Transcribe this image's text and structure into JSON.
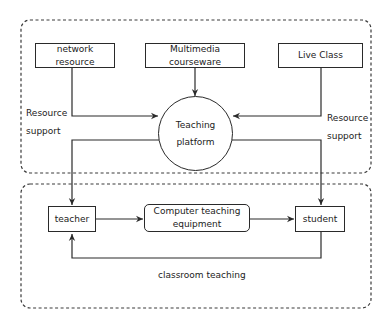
{
  "diagram": {
    "top_group": {
      "sources": [
        {
          "id": "network",
          "label": "network resource"
        },
        {
          "id": "multimedia",
          "label": "Multimedia courseware"
        },
        {
          "id": "live",
          "label": "Live Class"
        }
      ],
      "hub": {
        "line1": "Teaching",
        "line2": "platform"
      },
      "left_annotation": {
        "line1": "Resource",
        "line2": "support"
      },
      "right_annotation": {
        "line1": "Resource",
        "line2": "support"
      }
    },
    "bottom_group": {
      "teacher": "teacher",
      "equipment": {
        "line1": "Computer teaching",
        "line2": "equipment"
      },
      "student": "student",
      "loop_label": "classroom teaching"
    },
    "colors": {
      "stroke": "#2a2a2a",
      "dashed": "#3a3a3a",
      "background": "#ffffff"
    }
  }
}
